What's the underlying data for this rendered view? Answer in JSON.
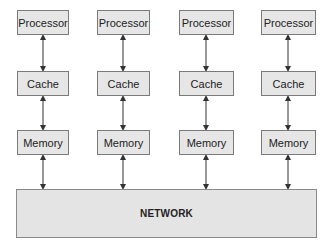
{
  "diagram": {
    "columns": [
      {
        "processor": "Processor",
        "cache": "Cache",
        "memory": "Memory"
      },
      {
        "processor": "Processor",
        "cache": "Cache",
        "memory": "Memory"
      },
      {
        "processor": "Processor",
        "cache": "Cache",
        "memory": "Memory"
      },
      {
        "processor": "Processor",
        "cache": "Cache",
        "memory": "Memory"
      }
    ],
    "network": "NETWORK",
    "colors": {
      "box_fill": "#e6e6e6",
      "box_border": "#7a7a7a",
      "arrow": "#333333"
    }
  }
}
